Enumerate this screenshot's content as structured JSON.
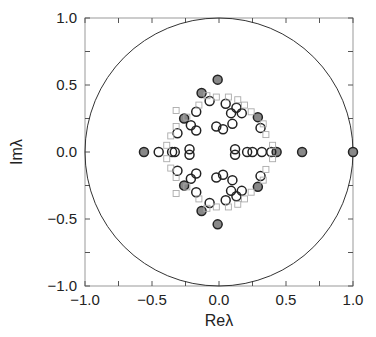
{
  "chart_data": {
    "type": "scatter",
    "title": "",
    "xlabel": "Reλ",
    "ylabel": "Imλ",
    "xlim": [
      -1.0,
      1.0
    ],
    "ylim": [
      -1.0,
      1.0
    ],
    "grid": false,
    "x_ticks": [
      "−1.0",
      "−0.5",
      "0.0",
      "0.5",
      "1.0"
    ],
    "x_tick_values": [
      -1.0,
      -0.5,
      0.0,
      0.5,
      1.0
    ],
    "y_ticks": [
      "−1.0",
      "−0.5",
      "0.0",
      "0.5",
      "1.0"
    ],
    "y_tick_values": [
      -1.0,
      -0.5,
      0.0,
      0.5,
      1.0
    ],
    "minor_tick_step": 0.25,
    "unit_circle": {
      "radius": 1.0,
      "color": "#333333"
    },
    "colors": {
      "circle_stroke": "#222222",
      "filled_circle_fill": "#888888",
      "square_stroke": "#aaaaaa",
      "frame": "#999999"
    },
    "series": [
      {
        "name": "filled-circles",
        "marker": "filled-circle",
        "points": [
          [
            -0.56,
            0.0
          ],
          [
            -0.26,
            0.25
          ],
          [
            -0.26,
            -0.25
          ],
          [
            -0.13,
            0.44
          ],
          [
            -0.13,
            -0.44
          ],
          [
            -0.01,
            0.54
          ],
          [
            -0.01,
            -0.54
          ],
          [
            0.29,
            0.26
          ],
          [
            0.29,
            -0.26
          ],
          [
            0.43,
            0.0
          ],
          [
            0.62,
            0.0
          ],
          [
            1.0,
            0.0
          ]
        ]
      },
      {
        "name": "open-circles",
        "marker": "circle",
        "points": [
          [
            -0.45,
            0.0
          ],
          [
            -0.35,
            0.0
          ],
          [
            -0.33,
            0.0
          ],
          [
            -0.22,
            0.02
          ],
          [
            -0.22,
            -0.02
          ],
          [
            0.12,
            0.02
          ],
          [
            0.12,
            -0.02
          ],
          [
            0.21,
            0.0
          ],
          [
            0.25,
            0.0
          ],
          [
            0.32,
            0.0
          ],
          [
            0.39,
            0.0
          ],
          [
            -0.07,
            0.38
          ],
          [
            -0.07,
            -0.38
          ],
          [
            0.05,
            0.36
          ],
          [
            0.05,
            -0.36
          ],
          [
            0.13,
            0.33
          ],
          [
            0.13,
            -0.33
          ],
          [
            0.09,
            0.29
          ],
          [
            0.09,
            -0.29
          ],
          [
            0.17,
            0.29
          ],
          [
            0.17,
            -0.29
          ],
          [
            -0.17,
            0.3
          ],
          [
            -0.17,
            -0.3
          ],
          [
            -0.21,
            0.2
          ],
          [
            -0.21,
            -0.2
          ],
          [
            -0.17,
            0.16
          ],
          [
            -0.17,
            -0.16
          ],
          [
            -0.02,
            0.19
          ],
          [
            -0.02,
            -0.19
          ],
          [
            0.03,
            0.17
          ],
          [
            0.03,
            -0.17
          ],
          [
            0.1,
            0.21
          ],
          [
            0.1,
            -0.21
          ],
          [
            0.31,
            0.18
          ],
          [
            0.31,
            -0.18
          ],
          [
            -0.31,
            0.14
          ],
          [
            -0.31,
            -0.14
          ]
        ]
      },
      {
        "name": "squares",
        "marker": "square",
        "points": [
          [
            -0.09,
            0.42
          ],
          [
            -0.02,
            0.41
          ],
          [
            0.07,
            0.41
          ],
          [
            0.14,
            0.39
          ],
          [
            0.19,
            0.35
          ],
          [
            0.24,
            0.3
          ],
          [
            0.33,
            0.21
          ],
          [
            0.35,
            0.13
          ],
          [
            0.4,
            0.05
          ],
          [
            -0.32,
            0.31
          ],
          [
            -0.32,
            0.19
          ],
          [
            -0.36,
            0.12
          ],
          [
            -0.39,
            0.05
          ],
          [
            -0.15,
            0.35
          ],
          [
            -0.24,
            0.26
          ],
          [
            -0.09,
            -0.42
          ],
          [
            -0.02,
            -0.41
          ],
          [
            0.07,
            -0.41
          ],
          [
            0.14,
            -0.39
          ],
          [
            0.19,
            -0.35
          ],
          [
            0.24,
            -0.3
          ],
          [
            0.33,
            -0.21
          ],
          [
            0.35,
            -0.13
          ],
          [
            0.4,
            -0.05
          ],
          [
            -0.32,
            -0.31
          ],
          [
            -0.32,
            -0.19
          ],
          [
            -0.36,
            -0.12
          ],
          [
            -0.39,
            -0.05
          ],
          [
            -0.15,
            -0.35
          ],
          [
            -0.24,
            -0.26
          ]
        ]
      }
    ]
  }
}
